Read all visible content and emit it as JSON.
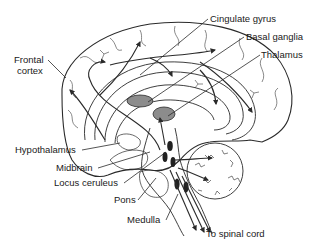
{
  "diagram": {
    "colors": {
      "line": "#2a2a2a",
      "fill_structure": "#8c8c8c",
      "nucleus": "#222222",
      "background": "#ffffff"
    },
    "labels": {
      "frontal_cortex_line1": "Frontal",
      "frontal_cortex_line2": "cortex",
      "cingulate_gyrus": "Cingulate gyrus",
      "basal_ganglia": "Basal ganglia",
      "thalamus": "Thalamus",
      "hypothalamus": "Hypothalamus",
      "midbrain": "Midbrain",
      "locus_ceruleus": "Locus ceruleus",
      "pons": "Pons",
      "medulla": "Medulla",
      "to_spinal_cord": "To spinal cord"
    }
  }
}
